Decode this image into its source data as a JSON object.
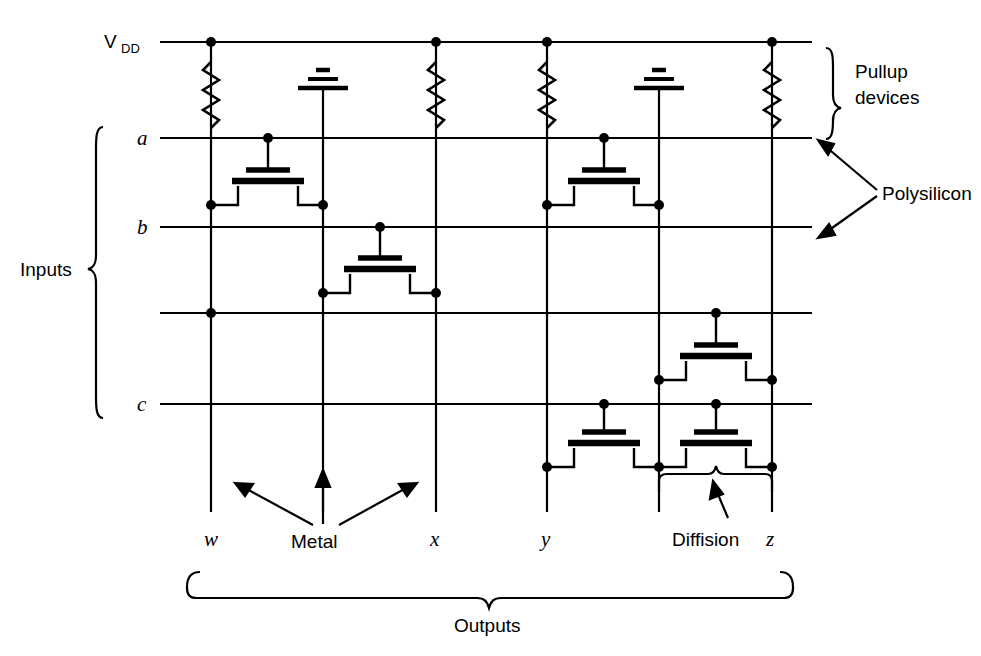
{
  "figure": {
    "type": "circuit-diagram",
    "background_color": "#ffffff",
    "line_color": "#000000"
  },
  "labels": {
    "vdd": "V",
    "vdd_sub": "DD",
    "inputs_bracket": "Inputs",
    "outputs_bracket": "Outputs",
    "pullup": "Pullup",
    "pullup2": "devices",
    "polysilicon": "Polysilicon",
    "metal": "Metal",
    "diffusion": "Diffision"
  },
  "input_rows": [
    {
      "label": "a",
      "y": 138,
      "x_start": 160,
      "x_end": 812
    },
    {
      "label": "b",
      "y": 227,
      "x_start": 160,
      "x_end": 812
    },
    {
      "label": "",
      "y": 313,
      "x_start": 160,
      "x_end": 812
    },
    {
      "label": "c",
      "y": 404,
      "x_start": 160,
      "x_end": 812
    }
  ],
  "vdd_rail": {
    "y": 42,
    "x_start": 160,
    "x_end": 812
  },
  "columns": [
    {
      "name": "w",
      "x": 211,
      "label": "w",
      "kind": "output",
      "top": 42,
      "bottom": 512,
      "pullup": true,
      "ground": false
    },
    {
      "name": "gnd1",
      "x": 323,
      "label": "",
      "kind": "ground",
      "top": 80,
      "bottom": 512,
      "pullup": false,
      "ground": true
    },
    {
      "name": "x",
      "x": 436,
      "label": "x",
      "kind": "output",
      "top": 42,
      "bottom": 512,
      "pullup": true,
      "ground": false
    },
    {
      "name": "y",
      "x": 547,
      "label": "y",
      "kind": "output",
      "top": 42,
      "bottom": 512,
      "pullup": true,
      "ground": false
    },
    {
      "name": "gnd2",
      "x": 659,
      "label": "",
      "kind": "ground",
      "top": 80,
      "bottom": 512,
      "pullup": false,
      "ground": true
    },
    {
      "name": "z",
      "x": 772,
      "label": "z",
      "kind": "output",
      "top": 42,
      "bottom": 512,
      "pullup": true,
      "ground": false
    }
  ],
  "transistors": [
    {
      "id": "t1",
      "gate_row": "a",
      "gate_x": 268,
      "source_x": 211,
      "drain_x": 323,
      "y": 205
    },
    {
      "id": "t2",
      "gate_row": "b",
      "gate_x": 380,
      "source_x": 323,
      "drain_x": 436,
      "y": 293
    },
    {
      "id": "t3",
      "gate_row": "a",
      "gate_x": 604,
      "source_x": 547,
      "drain_x": 659,
      "y": 205
    },
    {
      "id": "t4",
      "gate_row": "",
      "gate_x": 716,
      "source_x": 659,
      "drain_x": 772,
      "y": 380
    },
    {
      "id": "t5",
      "gate_row": "c",
      "gate_x": 604,
      "source_x": 547,
      "drain_x": 659,
      "y": 467
    },
    {
      "id": "t6",
      "gate_row": "c",
      "gate_x": 716,
      "source_x": 659,
      "drain_x": 772,
      "y": 467
    }
  ],
  "junction_dots": [
    {
      "x": 211,
      "y": 42
    },
    {
      "x": 436,
      "y": 42
    },
    {
      "x": 547,
      "y": 42
    },
    {
      "x": 772,
      "y": 42
    },
    {
      "x": 268,
      "y": 138
    },
    {
      "x": 604,
      "y": 138
    },
    {
      "x": 211,
      "y": 205
    },
    {
      "x": 323,
      "y": 205
    },
    {
      "x": 547,
      "y": 205
    },
    {
      "x": 659,
      "y": 205
    },
    {
      "x": 380,
      "y": 227
    },
    {
      "x": 716,
      "y": 313
    },
    {
      "x": 323,
      "y": 293
    },
    {
      "x": 436,
      "y": 293
    },
    {
      "x": 211,
      "y": 313
    },
    {
      "x": 659,
      "y": 380
    },
    {
      "x": 772,
      "y": 380
    },
    {
      "x": 604,
      "y": 404
    },
    {
      "x": 716,
      "y": 404
    },
    {
      "x": 547,
      "y": 467
    },
    {
      "x": 659,
      "y": 467
    },
    {
      "x": 772,
      "y": 467
    }
  ]
}
